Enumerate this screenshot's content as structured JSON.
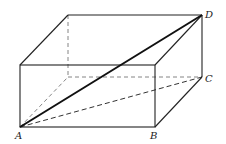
{
  "diagram": {
    "type": "rectangular-prism",
    "vertices": {
      "A": {
        "label": "A",
        "x": 20,
        "y": 127
      },
      "B": {
        "label": "B",
        "x": 155,
        "y": 127
      },
      "C": {
        "label": "C",
        "x": 202,
        "y": 77
      },
      "D": {
        "label": "D",
        "x": 202,
        "y": 15
      }
    },
    "labels": {
      "A": "A",
      "B": "B",
      "C": "C",
      "D": "D"
    },
    "edge_color": "#222222",
    "hidden_edge_color": "#555555"
  }
}
